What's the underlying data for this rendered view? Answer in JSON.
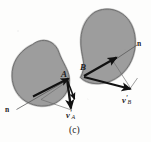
{
  "figure": {
    "caption": "(c)",
    "title_alt": "Two colliding rigid bodies A and B with post-impact velocity vectors along contact normal",
    "background_color": "#fdfdfc",
    "body_fill_color": "#9d9d9d",
    "body_stroke_color": "#4a4a4a",
    "vector_color": "#111111",
    "thin_line_color": "#5a5a5a"
  },
  "labels": {
    "normal_left": "n",
    "normal_right": "n",
    "point_a": "A",
    "point_b": "B",
    "velocity_a": {
      "symbol": "v",
      "prime": "'",
      "subscript": "A"
    },
    "velocity_b": {
      "symbol": "v",
      "prime": "'",
      "subscript": "B"
    }
  },
  "bodies": [
    {
      "name": "body-a",
      "label": "A",
      "position": "lower-left"
    },
    {
      "name": "body-b",
      "label": "B",
      "position": "upper-right"
    }
  ],
  "vectors": [
    {
      "name": "normal-line-left",
      "label": "n",
      "style": "thin",
      "from_point": "A"
    },
    {
      "name": "normal-line-right",
      "label": "n",
      "style": "thin",
      "from_point": "B"
    },
    {
      "name": "velocity-a-prime",
      "label": "v'A",
      "style": "thick-arrow",
      "from_point": "A"
    },
    {
      "name": "velocity-b-prime",
      "label": "v'B",
      "style": "thick-arrow",
      "from_point": "B"
    },
    {
      "name": "normal-component-a",
      "style": "thick-arrow",
      "from_point": "A"
    },
    {
      "name": "normal-component-b",
      "style": "thick-arrow",
      "from_point": "B"
    }
  ]
}
